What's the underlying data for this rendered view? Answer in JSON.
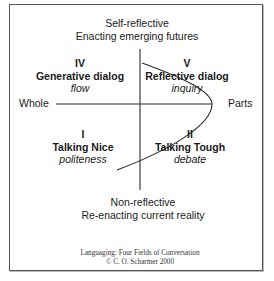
{
  "top_label": {
    "line1": "Self-reflective",
    "line2": "Enacting emerging futures"
  },
  "bottom_label": {
    "line1": "Non-reflective",
    "line2": "Re-enacting current reality"
  },
  "axis": {
    "left": "Whole",
    "right": "Parts"
  },
  "quadrants": [
    {
      "numeral": "IV",
      "title": "Generative dialog",
      "subtitle": "flow"
    },
    {
      "numeral": "V",
      "title": "Reflective dialog",
      "subtitle": "inquiry"
    },
    {
      "numeral": "I",
      "title": "Talking Nice",
      "subtitle": "politeness"
    },
    {
      "numeral": "II",
      "title": "Talking Tough",
      "subtitle": "debate"
    }
  ],
  "footer": {
    "line1": "Languaging: Four Fields of Conversation",
    "line2": "© C. O. Scharmer 2000"
  },
  "colors": {
    "line": "#2a2a2a",
    "border": "#555555",
    "text": "#1a1a1a"
  }
}
